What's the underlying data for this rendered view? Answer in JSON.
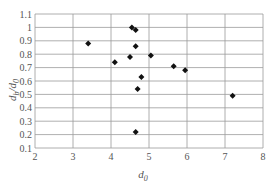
{
  "chart_data": {
    "type": "scatter",
    "title": "",
    "xlabel": "d_0",
    "ylabel": "d_b/d_0",
    "xlim": [
      2,
      8
    ],
    "ylim": [
      0.1,
      1.1
    ],
    "xticks": [
      2,
      3,
      4,
      5,
      6,
      7,
      8
    ],
    "yticks": [
      0.1,
      0.2,
      0.3,
      0.4,
      0.5,
      0.6,
      0.7,
      0.8,
      0.9,
      1,
      1.1
    ],
    "grid": true,
    "legend": null,
    "marker": "diamond",
    "marker_color": "#111111",
    "series": [
      {
        "name": "data",
        "points": [
          {
            "x": 3.4,
            "y": 0.88
          },
          {
            "x": 4.1,
            "y": 0.74
          },
          {
            "x": 4.5,
            "y": 0.78
          },
          {
            "x": 4.55,
            "y": 1.0
          },
          {
            "x": 4.65,
            "y": 0.98
          },
          {
            "x": 4.65,
            "y": 0.86
          },
          {
            "x": 4.8,
            "y": 0.63
          },
          {
            "x": 4.7,
            "y": 0.54
          },
          {
            "x": 4.65,
            "y": 0.22
          },
          {
            "x": 5.05,
            "y": 0.79
          },
          {
            "x": 5.65,
            "y": 0.71
          },
          {
            "x": 5.95,
            "y": 0.68
          },
          {
            "x": 7.2,
            "y": 0.49
          }
        ]
      }
    ]
  },
  "labels": {
    "x_main": "d",
    "x_sub": "0",
    "y_main": "d",
    "y_sub1": "b",
    "y_slash": "/d",
    "y_sub2": "0"
  }
}
